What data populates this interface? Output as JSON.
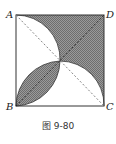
{
  "figure": {
    "caption": "图 9-80",
    "vertices": {
      "A": "A",
      "B": "B",
      "C": "C",
      "D": "D"
    },
    "colors": {
      "shade": "#8a8a8a",
      "line": "#333333",
      "dash": "#666666"
    }
  }
}
